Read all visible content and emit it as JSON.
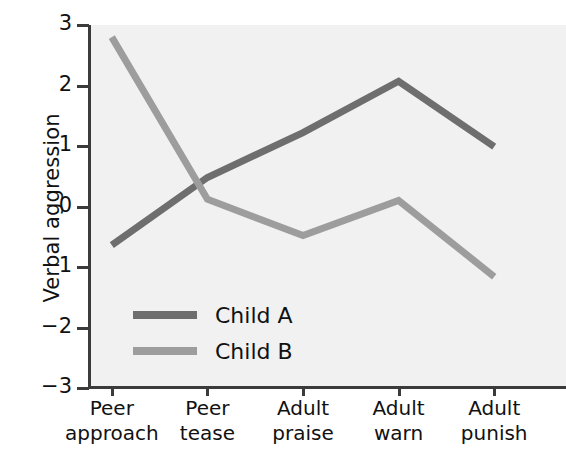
{
  "chart_data": {
    "type": "line",
    "title": "",
    "xlabel": "",
    "ylabel": "Verbal aggression",
    "ylim": [
      -3,
      3
    ],
    "yticks": [
      3,
      2,
      1,
      0,
      -1,
      -2,
      -3
    ],
    "ytick_labels": [
      "3",
      "2",
      "1",
      "0",
      "−1",
      "−2",
      "−3"
    ],
    "grid": false,
    "legend_position": "inside-lower-left",
    "categories": [
      "Peer approach",
      "Peer tease",
      "Adult praise",
      "Adult warn",
      "Adult punish"
    ],
    "category_lines": [
      [
        "Peer",
        "approach"
      ],
      [
        "Peer",
        "tease"
      ],
      [
        "Adult",
        "praise"
      ],
      [
        "Adult",
        "warn"
      ],
      [
        "Adult",
        "punish"
      ]
    ],
    "series": [
      {
        "name": "Child A",
        "color": "#6e6e6e",
        "values": [
          -0.64,
          0.48,
          1.22,
          2.07,
          0.99
        ]
      },
      {
        "name": "Child B",
        "color": "#9d9d9d",
        "values": [
          2.8,
          0.12,
          -0.48,
          0.1,
          -1.16
        ]
      }
    ]
  },
  "legend": {
    "items": [
      {
        "label": "Child A"
      },
      {
        "label": "Child B"
      }
    ]
  },
  "colors": {
    "plot_background": "#f1f1f1",
    "axis": "#3b3b3b",
    "page_background": "#ffffff",
    "text": "#111111"
  }
}
